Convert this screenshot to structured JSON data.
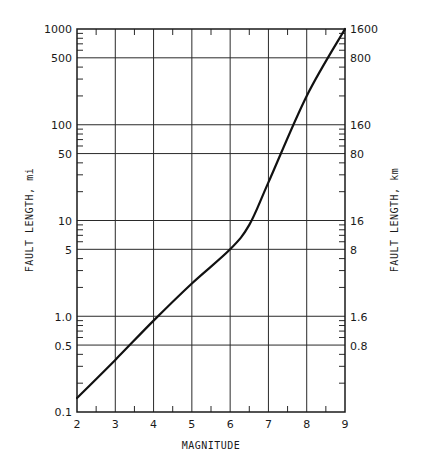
{
  "chart_data": {
    "type": "line",
    "title": "",
    "xlabel": "MAGNITUDE",
    "ylabel": "FAULT LENGTH, mi",
    "ylabel_right": "FAULT LENGTH, km",
    "xlim": [
      2,
      9
    ],
    "ylim": [
      0.1,
      1000
    ],
    "yscale": "log",
    "grid": true,
    "x_ticks": [
      "2",
      "3",
      "4",
      "5",
      "6",
      "7",
      "8",
      "9"
    ],
    "y_ticks_left": [
      "0.1",
      "0.5",
      "1.0",
      "5",
      "10",
      "50",
      "100",
      "500",
      "1000"
    ],
    "y_ticks_right": [
      "0.8",
      "1.6",
      "8",
      "16",
      "80",
      "160",
      "800",
      "1600"
    ],
    "series": [
      {
        "name": "Fault length vs magnitude",
        "x": [
          2,
          3,
          4,
          5,
          6,
          6.5,
          7,
          8,
          9
        ],
        "y": [
          0.14,
          0.35,
          0.9,
          2.2,
          5,
          9,
          25,
          200,
          1000
        ]
      }
    ]
  },
  "labels": {
    "xlabel": "MAGNITUDE",
    "ylabel_left": "FAULT LENGTH, mi",
    "ylabel_right": "FAULT LENGTH, km",
    "x_ticks": [
      "2",
      "3",
      "4",
      "5",
      "6",
      "7",
      "8",
      "9"
    ],
    "y_left": {
      "t1000": "1000",
      "t500": "500",
      "t100": "100",
      "t50": "50",
      "t10": "10",
      "t5": "5",
      "t1": "1.0",
      "t05": "0.5",
      "t01": "0.1"
    },
    "y_right": {
      "t1600": "1600",
      "t800": "800",
      "t160": "160",
      "t80": "80",
      "t16": "16",
      "t8": "8",
      "t16s": "1.6",
      "t08": "0.8"
    }
  }
}
